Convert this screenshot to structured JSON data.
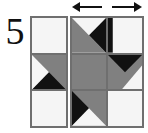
{
  "figure": {
    "number_label": "5",
    "width_px": 148,
    "height_px": 133
  },
  "colors": {
    "white": "#f5f5f5",
    "gray": "#808080",
    "black": "#111111",
    "outline": "#6f6f6f",
    "background": "#ffffff"
  },
  "arrows": [
    {
      "name": "arrow-left",
      "label": "",
      "direction": "left"
    },
    {
      "name": "arrow-right",
      "label": "",
      "direction": "right"
    }
  ],
  "blocks": [
    {
      "name": "left-strip",
      "columns": 1,
      "rows": 3,
      "cells": [
        {
          "name": "left-r1c1",
          "pattern": "solid-white",
          "row": 1,
          "col": 1
        },
        {
          "name": "left-r2c1",
          "pattern": "gray-upper-right-white-left-black-bottom",
          "row": 2,
          "col": 1
        },
        {
          "name": "left-r3c1",
          "pattern": "solid-white",
          "row": 3,
          "col": 1
        }
      ]
    },
    {
      "name": "right-block",
      "columns": 2,
      "rows": 3,
      "cells": [
        {
          "name": "right-r1c1",
          "pattern": "gray-lower-left-white-top-black-right",
          "row": 1,
          "col": 1
        },
        {
          "name": "right-r1c2",
          "pattern": "black-left-wedge-white",
          "row": 1,
          "col": 2
        },
        {
          "name": "right-r2c1",
          "pattern": "solid-gray",
          "row": 2,
          "col": 1
        },
        {
          "name": "right-r2c2",
          "pattern": "black-top-gray-left-white-lower-right",
          "row": 2,
          "col": 2
        },
        {
          "name": "right-r3c1",
          "pattern": "gray-upper-right-black-left-white-bottom",
          "row": 3,
          "col": 1
        },
        {
          "name": "right-r3c2",
          "pattern": "solid-white",
          "row": 3,
          "col": 2
        }
      ]
    }
  ]
}
